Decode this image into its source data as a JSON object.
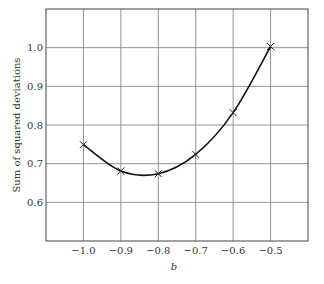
{
  "chart_data": {
    "type": "line",
    "title": "",
    "xlabel": "b",
    "ylabel": "Sum of squared deviations",
    "xlim": [
      -1.1,
      -0.4
    ],
    "ylim": [
      0.5,
      1.1
    ],
    "grid": true,
    "legend": null,
    "x_ticks": [
      -1.0,
      -0.9,
      -0.8,
      -0.7,
      -0.6,
      -0.5
    ],
    "x_tick_labels": [
      "−1.0",
      "−0.9",
      "−0.8",
      "−0.7",
      "−0.6",
      "−0.5"
    ],
    "y_ticks": [
      0.6,
      0.7,
      0.8,
      0.9,
      1.0
    ],
    "y_tick_labels": [
      "0.6",
      "0.7",
      "0.8",
      "0.9",
      "1.0"
    ],
    "series": [
      {
        "name": "Sum of squared deviations",
        "marker": "x",
        "line": "smooth",
        "x": [
          -1.0,
          -0.9,
          -0.8,
          -0.7,
          -0.6,
          -0.5
        ],
        "values": [
          0.749,
          0.681,
          0.674,
          0.724,
          0.832,
          1.003
        ]
      }
    ]
  }
}
